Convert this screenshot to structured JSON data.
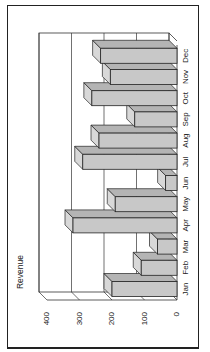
{
  "chart_data": {
    "type": "bar",
    "orientation_note": "3D column chart rendered rotated 90 degrees counter-clockwise",
    "title": "",
    "ylabel": "Revenue",
    "xlabel": "",
    "categories": [
      "Jan",
      "Feb",
      "Mar",
      "Apr",
      "May",
      "Jun",
      "Jul",
      "Aug",
      "Sep",
      "Oct",
      "Nov",
      "Dec"
    ],
    "values": [
      200,
      110,
      60,
      320,
      190,
      35,
      290,
      240,
      130,
      262,
      205,
      235
    ],
    "ylim": [
      0,
      400
    ],
    "yticks": [
      0,
      100,
      200,
      300,
      400
    ],
    "grid": true,
    "legend": false,
    "colors": {
      "bar_front": "#c8c8c8",
      "bar_top": "#d8d8d8",
      "bar_side": "#b4b4b4",
      "stroke": "#222222",
      "grid": "#333333"
    }
  }
}
